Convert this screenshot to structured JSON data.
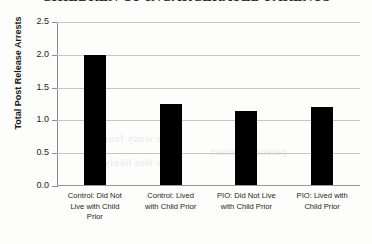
{
  "chart_data": {
    "type": "bar",
    "title": "CHILDREN OF INCARCERATED PARENTS",
    "xlabel": "",
    "ylabel": "Total Post Release Arrests",
    "categories": [
      "Control: Did Not Live with Child Prior",
      "Control: Lived with Child Prior",
      "PIO: Did Not Live with Child Prior",
      "PIO: Lived with Child Prior"
    ],
    "values": [
      2.0,
      1.25,
      1.15,
      1.2
    ],
    "ylim": [
      0.0,
      2.5
    ],
    "ytick_labels": [
      "0.0",
      "0.5",
      "1.0",
      "1.5",
      "2.0",
      "2.5"
    ],
    "ytick_values": [
      0.0,
      0.5,
      1.0,
      1.5,
      2.0,
      2.5
    ],
    "grid": true,
    "legend": false,
    "bar_color": "#000000",
    "gridline_color": "#c6c6c6"
  },
  "category_lines": [
    [
      "Control: Did Not",
      "Live with Child",
      "Prior"
    ],
    [
      "Control: Lived",
      "with Child Prior"
    ],
    [
      "PIO: Did Not Live",
      "with Child Prior"
    ],
    [
      "PIO: Lived with",
      "Child Prior"
    ]
  ],
  "bleed_text": {
    "line1": "the study found",
    "line2": "were less likely",
    "line3": "parental contact"
  }
}
